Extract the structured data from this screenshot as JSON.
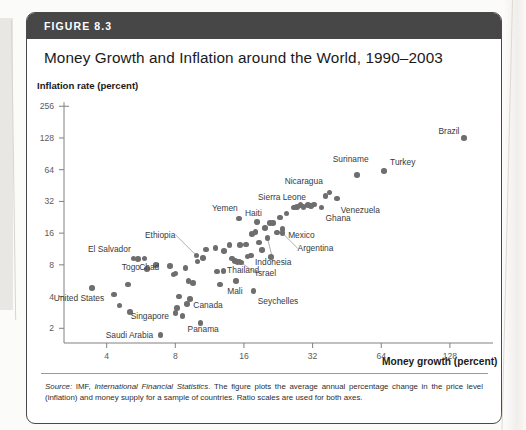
{
  "figure": {
    "number_label": "FIGURE 8.3",
    "title": "Money Growth and Inflation around the World, 1990–2003",
    "source_prefix": "Source:",
    "source_italic_1": " IMF,",
    "source_italic_2": " International Financial Statistics",
    "source_rest": ". The figure plots the average annual percentage change in the price level (inflation) and money supply for a sample of countries. Ratio scales are used for both axes."
  },
  "chart_data": {
    "type": "scatter",
    "title": "Money Growth and Inflation around the World, 1990–2003",
    "xlabel": "Money growth (percent)",
    "ylabel": "Inflation rate (percent)",
    "xscale": "log2",
    "yscale": "log2",
    "xlim": [
      2.6,
      190
    ],
    "ylim": [
      1.45,
      300
    ],
    "grid": false,
    "legend": "none",
    "xticks": [
      4,
      8,
      16,
      32,
      64,
      128
    ],
    "xtick_labels": [
      "4",
      "8",
      "16",
      "32",
      "64",
      "128"
    ],
    "yticks": [
      2,
      4,
      8,
      16,
      32,
      64,
      128,
      256
    ],
    "ytick_labels": [
      "2",
      "4",
      "8",
      "16",
      "32",
      "64",
      "128",
      "256"
    ],
    "points": [
      {
        "label": "Brazil",
        "x": 148,
        "y": 128,
        "anchor": "r",
        "lx": 141,
        "ly": 150,
        "leader": false
      },
      {
        "label": "Turkey",
        "x": 66,
        "y": 62,
        "anchor": "l",
        "lx": 70,
        "ly": 76,
        "leader": false
      },
      {
        "label": "Suriname",
        "x": 50,
        "y": 57,
        "anchor": "c",
        "lx": 47,
        "ly": 80,
        "leader": false
      },
      {
        "label": "Nicaragua",
        "x": 38,
        "y": 39,
        "anchor": "r",
        "lx": 35.5,
        "ly": 50,
        "leader": false
      },
      {
        "label": "Venezuela",
        "x": 41,
        "y": 34,
        "anchor": "l",
        "lx": 42.5,
        "ly": 26.5,
        "leader": false
      },
      {
        "label": "Ghana",
        "x": 35,
        "y": 28,
        "anchor": "l",
        "lx": 36.5,
        "ly": 22.5,
        "leader": false
      },
      {
        "label": "Sierra Leone",
        "x": 26.5,
        "y": 28,
        "anchor": "c",
        "lx": 23.5,
        "ly": 35,
        "leader": false
      },
      {
        "label": "Yemen",
        "x": 15.2,
        "y": 22,
        "anchor": "c",
        "lx": 13.2,
        "ly": 27.5,
        "leader": false
      },
      {
        "label": "Haiti",
        "x": 18.2,
        "y": 20.5,
        "anchor": "c",
        "lx": 17.6,
        "ly": 25,
        "leader": false
      },
      {
        "label": "Mexico",
        "x": 23.6,
        "y": 17.5,
        "anchor": "l",
        "lx": 25,
        "ly": 15.5,
        "leader": false
      },
      {
        "label": "Argentina",
        "x": 23.6,
        "y": 16.0,
        "anchor": "l",
        "lx": 27.5,
        "ly": 11.5,
        "leader": true
      },
      {
        "label": "Indonesia",
        "x": 20.3,
        "y": 14.3,
        "anchor": "c",
        "lx": 21.5,
        "ly": 8.6,
        "leader": true
      },
      {
        "label": "Ethiopia",
        "x": 9.9,
        "y": 9.8,
        "anchor": "r",
        "lx": 8.0,
        "ly": 15.5,
        "leader": true
      },
      {
        "label": "El Salvador",
        "x": 5.5,
        "y": 9.1,
        "anchor": "r",
        "lx": 5.1,
        "ly": 11.3,
        "leader": false
      },
      {
        "label": "Togo",
        "x": 6.0,
        "y": 7.3,
        "anchor": "r",
        "lx": 5.6,
        "ly": 7.7,
        "leader": false
      },
      {
        "label": "Chad",
        "x": 7.6,
        "y": 7.8,
        "anchor": "r",
        "lx": 6.8,
        "ly": 7.6,
        "leader": false
      },
      {
        "label": "Thailand",
        "x": 13.0,
        "y": 7.0,
        "anchor": "l",
        "lx": 13.5,
        "ly": 7.1,
        "leader": false
      },
      {
        "label": "Israel",
        "x": 15.3,
        "y": 8.6,
        "anchor": "l",
        "lx": 18.0,
        "ly": 6.7,
        "leader": true
      },
      {
        "label": "Mali",
        "x": 14.8,
        "y": 5.6,
        "anchor": "c",
        "lx": 14.6,
        "ly": 4.5,
        "leader": false
      },
      {
        "label": "Seychelles",
        "x": 17.6,
        "y": 4.5,
        "anchor": "l",
        "lx": 18.4,
        "ly": 3.6,
        "leader": false
      },
      {
        "label": "Canada",
        "x": 9.0,
        "y": 3.4,
        "anchor": "l",
        "lx": 9.6,
        "ly": 3.3,
        "leader": false
      },
      {
        "label": "Singapore",
        "x": 8.0,
        "y": 2.8,
        "anchor": "r",
        "lx": 7.5,
        "ly": 2.6,
        "leader": false
      },
      {
        "label": "Panama",
        "x": 10.3,
        "y": 2.25,
        "anchor": "c",
        "lx": 10.6,
        "ly": 1.95,
        "leader": false
      },
      {
        "label": "United States",
        "x": 4.3,
        "y": 4.2,
        "anchor": "r",
        "lx": 3.9,
        "ly": 3.9,
        "leader": false
      },
      {
        "label": "Saudi Arabia",
        "x": 6.9,
        "y": 1.72,
        "anchor": "r",
        "lx": 6.4,
        "ly": 1.72,
        "leader": false
      }
    ],
    "unlabeled_points": [
      {
        "x": 3.45,
        "y": 4.8
      },
      {
        "x": 4.95,
        "y": 5.2
      },
      {
        "x": 5.25,
        "y": 9.2
      },
      {
        "x": 5.85,
        "y": 9.2
      },
      {
        "x": 4.55,
        "y": 3.3
      },
      {
        "x": 5.05,
        "y": 2.85
      },
      {
        "x": 6.6,
        "y": 8.0
      },
      {
        "x": 7.85,
        "y": 6.5
      },
      {
        "x": 8.0,
        "y": 6.6
      },
      {
        "x": 8.3,
        "y": 4.0
      },
      {
        "x": 8.15,
        "y": 3.1
      },
      {
        "x": 8.6,
        "y": 2.6
      },
      {
        "x": 8.85,
        "y": 7.5
      },
      {
        "x": 9.15,
        "y": 5.6
      },
      {
        "x": 9.55,
        "y": 5.4
      },
      {
        "x": 9.3,
        "y": 3.8
      },
      {
        "x": 10.0,
        "y": 8.6
      },
      {
        "x": 10.6,
        "y": 9.3
      },
      {
        "x": 10.9,
        "y": 11.2
      },
      {
        "x": 12.0,
        "y": 11.6
      },
      {
        "x": 12.2,
        "y": 6.9
      },
      {
        "x": 12.6,
        "y": 5.2
      },
      {
        "x": 13.1,
        "y": 10.8
      },
      {
        "x": 13.8,
        "y": 12.3
      },
      {
        "x": 14.2,
        "y": 9.2
      },
      {
        "x": 14.6,
        "y": 8.7
      },
      {
        "x": 15.0,
        "y": 8.5
      },
      {
        "x": 15.4,
        "y": 12.4
      },
      {
        "x": 15.5,
        "y": 8.4
      },
      {
        "x": 16.3,
        "y": 12.5
      },
      {
        "x": 16.6,
        "y": 9.6
      },
      {
        "x": 17.2,
        "y": 9.8
      },
      {
        "x": 17.4,
        "y": 15.6
      },
      {
        "x": 18.0,
        "y": 16.3
      },
      {
        "x": 18.6,
        "y": 13.0
      },
      {
        "x": 19.2,
        "y": 11.0
      },
      {
        "x": 19.8,
        "y": 17.8
      },
      {
        "x": 20.8,
        "y": 20.0
      },
      {
        "x": 21.4,
        "y": 20.0
      },
      {
        "x": 21.0,
        "y": 9.5
      },
      {
        "x": 22.3,
        "y": 16.2
      },
      {
        "x": 23.0,
        "y": 22.5
      },
      {
        "x": 24.6,
        "y": 24.5
      },
      {
        "x": 27.4,
        "y": 28.5
      },
      {
        "x": 28.3,
        "y": 29.5
      },
      {
        "x": 29.2,
        "y": 28.5
      },
      {
        "x": 30.6,
        "y": 29.5
      },
      {
        "x": 31.5,
        "y": 29.0
      },
      {
        "x": 32.5,
        "y": 30.0
      },
      {
        "x": 36.5,
        "y": 36.0
      }
    ]
  }
}
